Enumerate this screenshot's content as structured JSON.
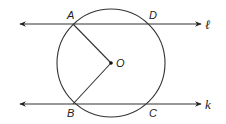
{
  "diagram": {
    "type": "geometry",
    "colors": {
      "stroke": "#333333",
      "background": "#ffffff"
    },
    "circle": {
      "center_label": "O",
      "cx": 111,
      "cy": 63,
      "r": 54
    },
    "lines": [
      {
        "name": "ℓ",
        "y": 24,
        "x_start": 20,
        "x_end": 201
      },
      {
        "name": "k",
        "y": 104,
        "x_start": 20,
        "x_end": 201
      }
    ],
    "points": {
      "A": {
        "label": "A",
        "x": 73,
        "y": 24
      },
      "D": {
        "label": "D",
        "x": 149,
        "y": 24
      },
      "B": {
        "label": "B",
        "x": 73,
        "y": 104
      },
      "C": {
        "label": "C",
        "x": 149,
        "y": 104
      },
      "O": {
        "label": "O",
        "x": 111,
        "y": 63
      }
    },
    "segments": [
      "OA",
      "OB"
    ]
  }
}
